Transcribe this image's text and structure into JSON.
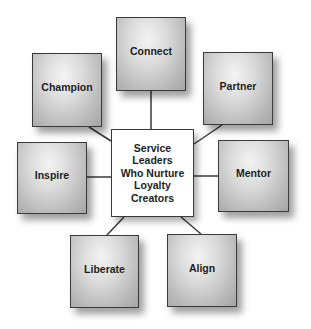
{
  "diagram": {
    "type": "hub-and-spoke",
    "center": {
      "lines": [
        "Service",
        "Leaders",
        "Who Nurture",
        "Loyalty",
        "Creators"
      ]
    },
    "nodes": [
      {
        "id": "connect",
        "label": "Connect"
      },
      {
        "id": "champion",
        "label": "Champion"
      },
      {
        "id": "partner",
        "label": "Partner"
      },
      {
        "id": "inspire",
        "label": "Inspire"
      },
      {
        "id": "mentor",
        "label": "Mentor"
      },
      {
        "id": "liberate",
        "label": "Liberate"
      },
      {
        "id": "align",
        "label": "Align"
      }
    ],
    "colors": {
      "border": "#3a3a3a",
      "text": "#1e1e1e",
      "node_fill_light": "#f4f4f4",
      "node_fill_dark": "#a4a4a4",
      "center_fill": "#ffffff",
      "connector": "#3a3a3a"
    }
  }
}
